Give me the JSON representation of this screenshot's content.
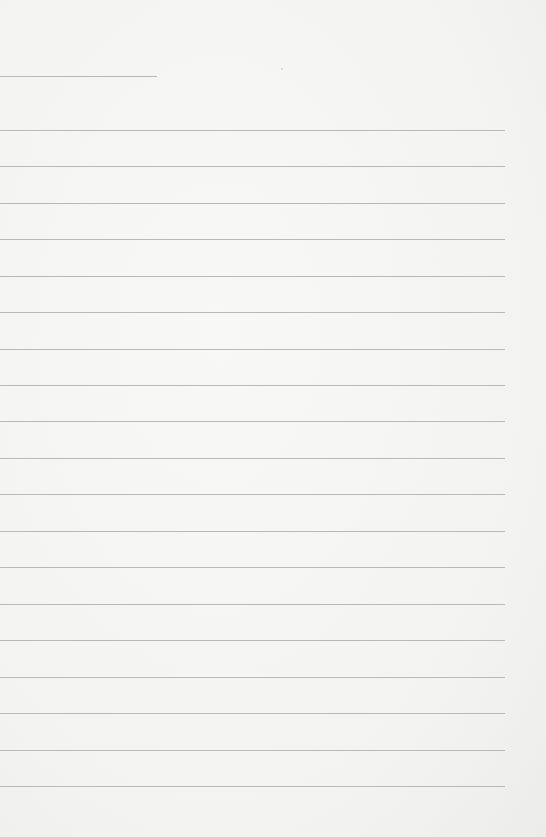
{
  "page": {
    "type": "lined-paper",
    "background_color": "#f5f5f3",
    "rule_color": "#b9b9b7",
    "short_rule": {
      "y": 76,
      "x_start": 0,
      "x_end": 157
    },
    "rules": {
      "x_start": 0,
      "x_end": 505,
      "y_positions": [
        130,
        166,
        203,
        239,
        276,
        312,
        349,
        385,
        421,
        458,
        494,
        531,
        567,
        604,
        640,
        677,
        713,
        750,
        786
      ]
    },
    "specks": [
      {
        "x": 281,
        "y": 68
      }
    ]
  }
}
